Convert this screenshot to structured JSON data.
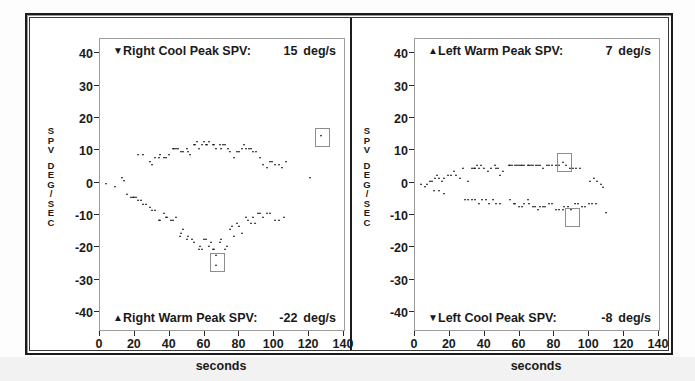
{
  "figure": {
    "xaxis_title": "seconds",
    "yaxis_caption_top": "SPV",
    "yaxis_caption_bottom": "DEG/SEC",
    "xticks": [
      "0",
      "20",
      "40",
      "60",
      "80",
      "100",
      "120",
      "140"
    ],
    "yticks": [
      "40",
      "30",
      "20",
      "10",
      "0",
      "-10",
      "-20",
      "-30",
      "-40"
    ],
    "units": "deg/s"
  },
  "panels": [
    {
      "id": "right-ear",
      "top_banner": {
        "marker": "down-triangle-marker",
        "marker_glyph": "▼",
        "label": "Right Cool Peak SPV:",
        "value": "15",
        "units": "deg/s"
      },
      "bottom_banner": {
        "marker": "up-triangle-marker",
        "marker_glyph": "▲",
        "label": "Right Warm Peak SPV:",
        "value": "-22",
        "units": "deg/s"
      }
    },
    {
      "id": "left-ear",
      "top_banner": {
        "marker": "up-triangle-marker",
        "marker_glyph": "▲",
        "label": "Left Warm Peak SPV:",
        "value": "7",
        "units": "deg/s"
      },
      "bottom_banner": {
        "marker": "down-triangle-marker",
        "marker_glyph": "▼",
        "label": "Left Cool Peak SPV:",
        "value": "-8",
        "units": "deg/s"
      }
    }
  ],
  "chart_data": [
    {
      "type": "scatter",
      "title": "Right Cool Peak SPV: 15 deg/s  /  Right Warm Peak SPV: -22 deg/s",
      "xlabel": "seconds",
      "ylabel": "SPV DEG/SEC",
      "xlim": [
        0,
        140
      ],
      "ylim": [
        -45,
        45
      ],
      "grid": false,
      "legend": "none",
      "peak_markers": [
        {
          "name": "right-cool-peak",
          "x": 127,
          "y": 15
        },
        {
          "name": "right-warm-peak",
          "x": 67,
          "y": -22
        }
      ],
      "series": [
        {
          "name": "Right Cool",
          "marker": "down-triangle",
          "points": [
            [
              4,
              0
            ],
            [
              9,
              -1
            ],
            [
              13,
              2
            ],
            [
              14,
              1
            ],
            [
              22,
              9
            ],
            [
              25,
              9
            ],
            [
              29,
              7
            ],
            [
              30,
              6
            ],
            [
              32,
              8
            ],
            [
              34,
              8
            ],
            [
              35,
              9
            ],
            [
              37,
              8
            ],
            [
              38,
              8
            ],
            [
              40,
              9
            ],
            [
              42,
              11
            ],
            [
              43,
              11
            ],
            [
              44,
              11
            ],
            [
              45,
              11
            ],
            [
              47,
              10
            ],
            [
              48,
              10
            ],
            [
              50,
              11
            ],
            [
              51,
              10
            ],
            [
              52,
              9
            ],
            [
              54,
              12
            ],
            [
              55,
              12
            ],
            [
              56,
              13
            ],
            [
              57,
              11
            ],
            [
              59,
              12
            ],
            [
              60,
              13
            ],
            [
              61,
              12
            ],
            [
              62,
              12
            ],
            [
              63,
              13
            ],
            [
              65,
              12
            ],
            [
              66,
              12
            ],
            [
              67,
              11
            ],
            [
              69,
              12
            ],
            [
              70,
              11
            ],
            [
              71,
              12
            ],
            [
              72,
              12
            ],
            [
              74,
              11
            ],
            [
              75,
              10
            ],
            [
              77,
              8
            ],
            [
              79,
              10
            ],
            [
              80,
              10
            ],
            [
              82,
              11
            ],
            [
              83,
              12
            ],
            [
              84,
              11
            ],
            [
              86,
              11
            ],
            [
              87,
              11
            ],
            [
              88,
              10
            ],
            [
              90,
              10
            ],
            [
              92,
              8
            ],
            [
              94,
              6
            ],
            [
              96,
              5
            ],
            [
              98,
              7
            ],
            [
              99,
              7
            ],
            [
              101,
              6
            ],
            [
              103,
              6
            ],
            [
              105,
              5
            ],
            [
              107,
              7
            ],
            [
              121,
              2
            ],
            [
              127,
              15
            ]
          ]
        },
        {
          "name": "Right Warm",
          "marker": "up-triangle",
          "points": [
            [
              16,
              -3
            ],
            [
              18,
              -4
            ],
            [
              19,
              -4
            ],
            [
              20,
              -4
            ],
            [
              21,
              -4
            ],
            [
              22,
              -5
            ],
            [
              24,
              -5
            ],
            [
              25,
              -6
            ],
            [
              27,
              -6
            ],
            [
              29,
              -7
            ],
            [
              30,
              -8
            ],
            [
              32,
              -8
            ],
            [
              34,
              -11
            ],
            [
              35,
              -11
            ],
            [
              37,
              -9
            ],
            [
              38,
              -10
            ],
            [
              39,
              -10
            ],
            [
              41,
              -11
            ],
            [
              42,
              -11
            ],
            [
              44,
              -10
            ],
            [
              46,
              -16
            ],
            [
              47,
              -15
            ],
            [
              48,
              -14
            ],
            [
              50,
              -17
            ],
            [
              51,
              -16
            ],
            [
              53,
              -17
            ],
            [
              54,
              -18
            ],
            [
              57,
              -20
            ],
            [
              58,
              -19
            ],
            [
              59,
              -20
            ],
            [
              60,
              -17
            ],
            [
              61,
              -17
            ],
            [
              63,
              -19
            ],
            [
              64,
              -18
            ],
            [
              65,
              -20
            ],
            [
              66,
              -20
            ],
            [
              67,
              -22
            ],
            [
              67,
              -25
            ],
            [
              69,
              -18
            ],
            [
              70,
              -17
            ],
            [
              72,
              -20
            ],
            [
              73,
              -19
            ],
            [
              75,
              -14
            ],
            [
              76,
              -13
            ],
            [
              77,
              -16
            ],
            [
              79,
              -12
            ],
            [
              80,
              -13
            ],
            [
              82,
              -15
            ],
            [
              84,
              -10
            ],
            [
              85,
              -11
            ],
            [
              87,
              -12
            ],
            [
              88,
              -10
            ],
            [
              89,
              -12
            ],
            [
              91,
              -9
            ],
            [
              92,
              -9
            ],
            [
              94,
              -10
            ],
            [
              96,
              -9
            ],
            [
              98,
              -9
            ],
            [
              101,
              -11
            ],
            [
              103,
              -11
            ],
            [
              106,
              -10
            ]
          ]
        }
      ]
    },
    {
      "type": "scatter",
      "title": "Left Warm Peak SPV: 7 deg/s  /  Left Cool Peak SPV: -8 deg/s",
      "xlabel": "seconds",
      "ylabel": "SPV DEG/SEC",
      "xlim": [
        0,
        140
      ],
      "ylim": [
        -45,
        45
      ],
      "grid": false,
      "legend": "none",
      "peak_markers": [
        {
          "name": "left-warm-peak",
          "x": 85,
          "y": 7
        },
        {
          "name": "left-cool-peak",
          "x": 90,
          "y": -8
        }
      ],
      "series": [
        {
          "name": "Left Warm",
          "marker": "up-triangle",
          "points": [
            [
              4,
              0
            ],
            [
              7,
              0
            ],
            [
              9,
              1
            ],
            [
              10,
              1
            ],
            [
              12,
              2
            ],
            [
              13,
              3
            ],
            [
              14,
              2
            ],
            [
              16,
              1
            ],
            [
              17,
              2
            ],
            [
              19,
              3
            ],
            [
              21,
              3
            ],
            [
              23,
              4
            ],
            [
              24,
              3
            ],
            [
              26,
              2
            ],
            [
              28,
              5
            ],
            [
              31,
              1
            ],
            [
              33,
              5
            ],
            [
              34,
              5
            ],
            [
              35,
              5
            ],
            [
              36,
              6
            ],
            [
              37,
              5
            ],
            [
              38,
              6
            ],
            [
              40,
              5
            ],
            [
              42,
              4
            ],
            [
              44,
              5
            ],
            [
              46,
              6
            ],
            [
              47,
              5
            ],
            [
              48,
              5
            ],
            [
              49,
              3
            ],
            [
              51,
              4
            ],
            [
              54,
              6
            ],
            [
              55,
              6
            ],
            [
              56,
              6
            ],
            [
              58,
              6
            ],
            [
              59,
              6
            ],
            [
              60,
              6
            ],
            [
              61,
              6
            ],
            [
              62,
              6
            ],
            [
              63,
              6
            ],
            [
              65,
              6
            ],
            [
              66,
              6
            ],
            [
              67,
              6
            ],
            [
              68,
              6
            ],
            [
              70,
              6
            ],
            [
              71,
              6
            ],
            [
              72,
              6
            ],
            [
              74,
              5
            ],
            [
              76,
              6
            ],
            [
              77,
              6
            ],
            [
              79,
              6
            ],
            [
              81,
              6
            ],
            [
              83,
              6
            ],
            [
              85,
              7
            ],
            [
              87,
              6
            ],
            [
              89,
              5
            ],
            [
              91,
              5
            ],
            [
              93,
              5
            ],
            [
              95,
              5
            ],
            [
              101,
              1
            ],
            [
              103,
              2
            ],
            [
              105,
              1
            ],
            [
              107,
              0
            ],
            [
              108,
              -1
            ]
          ]
        },
        {
          "name": "Left Cool",
          "marker": "down-triangle",
          "points": [
            [
              6,
              -1
            ],
            [
              11,
              -2
            ],
            [
              14,
              -2
            ],
            [
              17,
              -3
            ],
            [
              29,
              -5
            ],
            [
              31,
              -5
            ],
            [
              33,
              -5
            ],
            [
              35,
              -5
            ],
            [
              37,
              -6
            ],
            [
              39,
              -5
            ],
            [
              41,
              -5
            ],
            [
              43,
              -6
            ],
            [
              45,
              -5
            ],
            [
              47,
              -6
            ],
            [
              49,
              -6
            ],
            [
              55,
              -5
            ],
            [
              57,
              -6
            ],
            [
              58,
              -6
            ],
            [
              60,
              -7
            ],
            [
              62,
              -7
            ],
            [
              63,
              -6
            ],
            [
              65,
              -5
            ],
            [
              66,
              -6
            ],
            [
              68,
              -7
            ],
            [
              69,
              -7
            ],
            [
              71,
              -8
            ],
            [
              72,
              -7
            ],
            [
              74,
              -7
            ],
            [
              75,
              -7
            ],
            [
              77,
              -6
            ],
            [
              79,
              -6
            ],
            [
              81,
              -8
            ],
            [
              83,
              -8
            ],
            [
              85,
              -8
            ],
            [
              86,
              -7
            ],
            [
              88,
              -7
            ],
            [
              90,
              -8
            ],
            [
              92,
              -6
            ],
            [
              94,
              -6
            ],
            [
              96,
              -7
            ],
            [
              98,
              -7
            ],
            [
              100,
              -6
            ],
            [
              102,
              -6
            ],
            [
              104,
              -6
            ],
            [
              110,
              -9
            ]
          ]
        }
      ]
    }
  ]
}
